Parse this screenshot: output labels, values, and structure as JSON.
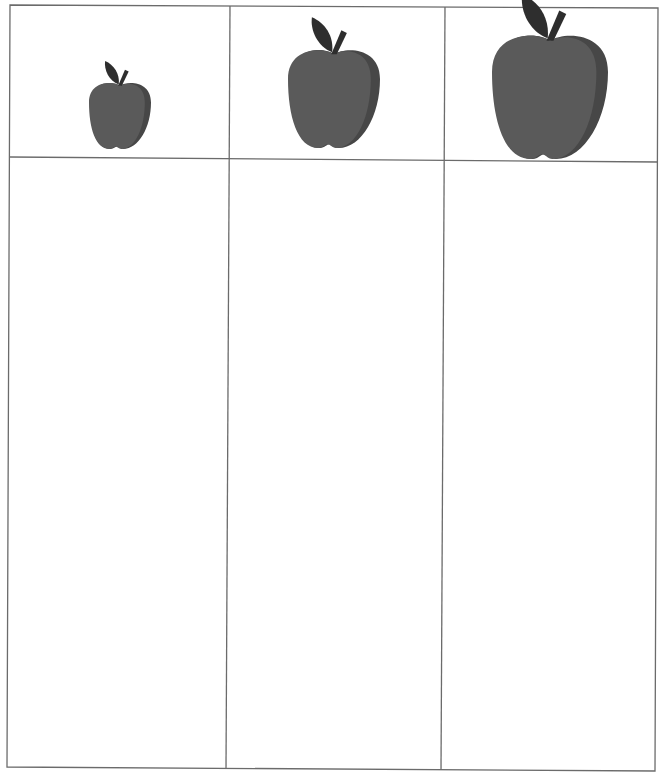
{
  "worksheet": {
    "type": "size-sorting table",
    "columns": [
      {
        "header_icon": "apple-icon",
        "size": "small",
        "cell_text": ""
      },
      {
        "header_icon": "apple-icon",
        "size": "medium",
        "cell_text": ""
      },
      {
        "header_icon": "apple-icon",
        "size": "large",
        "cell_text": ""
      }
    ]
  },
  "colors": {
    "grid_line": "#6b6b6b",
    "apple": "#5a5a5a",
    "apple_shade": "#474747",
    "leaf": "#2e2e2e",
    "background": "#ffffff"
  }
}
